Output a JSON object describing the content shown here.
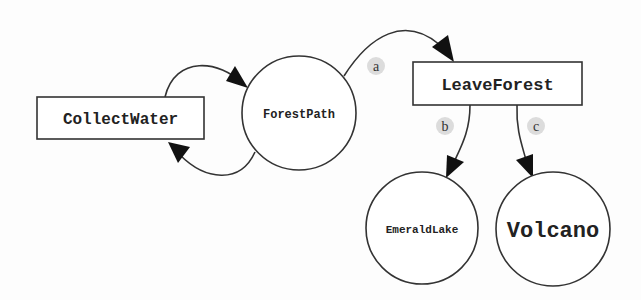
{
  "diagram": {
    "type": "state-graph",
    "nodes": [
      {
        "id": "collect_water",
        "label": "CollectWater",
        "shape": "rectangle"
      },
      {
        "id": "forest_path",
        "label": "ForestPath",
        "shape": "circle"
      },
      {
        "id": "leave_forest",
        "label": "LeaveForest",
        "shape": "rectangle"
      },
      {
        "id": "emerald_lake",
        "label": "EmeraldLake",
        "shape": "circle"
      },
      {
        "id": "volcano",
        "label": "Volcano",
        "shape": "circle"
      }
    ],
    "edges": [
      {
        "from": "collect_water",
        "to": "forest_path",
        "label": ""
      },
      {
        "from": "forest_path",
        "to": "collect_water",
        "label": ""
      },
      {
        "from": "forest_path",
        "to": "leave_forest",
        "label": "a"
      },
      {
        "from": "leave_forest",
        "to": "emerald_lake",
        "label": "b"
      },
      {
        "from": "leave_forest",
        "to": "volcano",
        "label": "c"
      }
    ],
    "colors": {
      "stroke": "#333333",
      "arrow": "#111111",
      "label_bg": "#dddddd",
      "node_fill": "#ffffff"
    }
  }
}
